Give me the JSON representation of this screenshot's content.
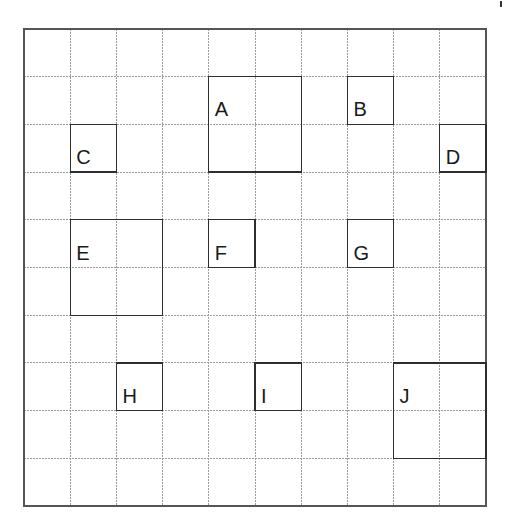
{
  "diagram": {
    "type": "grid-with-labeled-regions",
    "grid": {
      "columns": 10,
      "rows": 10,
      "gridline_color": "#9c9c9c",
      "frame_color": "#555555",
      "box_color": "#2e2e2e",
      "label_color": "#1a1a1a"
    },
    "boxes": [
      {
        "label": "A",
        "col": 4,
        "row": 1,
        "col_span": 2,
        "row_span": 2
      },
      {
        "label": "B",
        "col": 7,
        "row": 1,
        "col_span": 1,
        "row_span": 1
      },
      {
        "label": "C",
        "col": 1,
        "row": 2,
        "col_span": 1,
        "row_span": 1
      },
      {
        "label": "D",
        "col": 9,
        "row": 2,
        "col_span": 1,
        "row_span": 1
      },
      {
        "label": "E",
        "col": 1,
        "row": 4,
        "col_span": 2,
        "row_span": 2
      },
      {
        "label": "F",
        "col": 4,
        "row": 4,
        "col_span": 1,
        "row_span": 1
      },
      {
        "label": "G",
        "col": 7,
        "row": 4,
        "col_span": 1,
        "row_span": 1
      },
      {
        "label": "H",
        "col": 2,
        "row": 7,
        "col_span": 1,
        "row_span": 1
      },
      {
        "label": "I",
        "col": 5,
        "row": 7,
        "col_span": 1,
        "row_span": 1
      },
      {
        "label": "J",
        "col": 8,
        "row": 7,
        "col_span": 2,
        "row_span": 2
      }
    ]
  }
}
